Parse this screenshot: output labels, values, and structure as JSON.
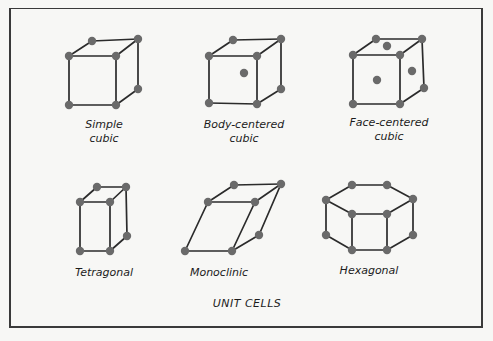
{
  "title": "UNIT CELLS",
  "colors": {
    "edge": "#2b2b2b",
    "atom": "#6a6a6a",
    "background": "#f7f7f5",
    "frame": "#3a3a3a"
  },
  "cells": [
    {
      "id": "simple-cubic",
      "label_line1": "Simple",
      "label_line2": "cubic",
      "label_pos": [
        104,
        118
      ],
      "vertices": [
        [
          69,
          56
        ],
        [
          116,
          56
        ],
        [
          92,
          41
        ],
        [
          138,
          39
        ],
        [
          69,
          105
        ],
        [
          116,
          105
        ],
        [
          138,
          89
        ]
      ],
      "edges": [
        [
          0,
          1
        ],
        [
          0,
          2
        ],
        [
          2,
          3
        ],
        [
          1,
          3
        ],
        [
          0,
          4
        ],
        [
          1,
          5
        ],
        [
          4,
          5
        ],
        [
          5,
          6
        ],
        [
          3,
          6
        ]
      ],
      "extra_atoms": []
    },
    {
      "id": "body-centered-cubic",
      "label_line1": "Body-centered",
      "label_line2": "cubic",
      "label_pos": [
        244,
        118
      ],
      "vertices": [
        [
          209,
          56
        ],
        [
          257,
          56
        ],
        [
          233,
          40
        ],
        [
          281,
          39
        ],
        [
          209,
          103
        ],
        [
          257,
          104
        ],
        [
          281,
          89
        ]
      ],
      "edges": [
        [
          0,
          1
        ],
        [
          0,
          2
        ],
        [
          2,
          3
        ],
        [
          1,
          3
        ],
        [
          0,
          4
        ],
        [
          1,
          5
        ],
        [
          4,
          5
        ],
        [
          5,
          6
        ],
        [
          3,
          6
        ]
      ],
      "extra_atoms": [
        [
          244,
          73
        ]
      ]
    },
    {
      "id": "face-centered-cubic",
      "label_line1": "Face-centered",
      "label_line2": "cubic",
      "label_pos": [
        389,
        116
      ],
      "vertices": [
        [
          353,
          55
        ],
        [
          400,
          55
        ],
        [
          376,
          39
        ],
        [
          422,
          39
        ],
        [
          353,
          104
        ],
        [
          400,
          104
        ],
        [
          424,
          88
        ]
      ],
      "edges": [
        [
          0,
          1
        ],
        [
          0,
          2
        ],
        [
          2,
          3
        ],
        [
          1,
          3
        ],
        [
          0,
          4
        ],
        [
          1,
          5
        ],
        [
          4,
          5
        ],
        [
          5,
          6
        ],
        [
          3,
          6
        ]
      ],
      "extra_atoms": [
        [
          387,
          46
        ],
        [
          377,
          80
        ],
        [
          412,
          71
        ]
      ]
    },
    {
      "id": "tetragonal",
      "label_line1": "Tetragonal",
      "label_line2": "",
      "label_pos": [
        104,
        266
      ],
      "vertices": [
        [
          80,
          202
        ],
        [
          110,
          202
        ],
        [
          97,
          187
        ],
        [
          126,
          187
        ],
        [
          80,
          251
        ],
        [
          110,
          251
        ],
        [
          127,
          236
        ]
      ],
      "edges": [
        [
          0,
          1
        ],
        [
          0,
          2
        ],
        [
          2,
          3
        ],
        [
          1,
          3
        ],
        [
          0,
          4
        ],
        [
          1,
          5
        ],
        [
          4,
          5
        ],
        [
          5,
          6
        ],
        [
          3,
          6
        ]
      ],
      "extra_atoms": []
    },
    {
      "id": "monoclinic",
      "label_line1": "Monoclinic",
      "label_line2": "",
      "label_pos": [
        219,
        266
      ],
      "vertices": [
        [
          208,
          202
        ],
        [
          255,
          202
        ],
        [
          234,
          185
        ],
        [
          281,
          184
        ],
        [
          185,
          251
        ],
        [
          232,
          251
        ],
        [
          259,
          235
        ]
      ],
      "edges": [
        [
          0,
          1
        ],
        [
          0,
          2
        ],
        [
          2,
          3
        ],
        [
          1,
          3
        ],
        [
          0,
          4
        ],
        [
          1,
          5
        ],
        [
          4,
          5
        ],
        [
          5,
          6
        ],
        [
          3,
          6
        ]
      ],
      "extra_atoms": []
    },
    {
      "id": "hexagonal",
      "label_line1": "Hexagonal",
      "label_line2": "",
      "label_pos": [
        369,
        264
      ],
      "vertices": [
        [
          352,
          185
        ],
        [
          387,
          185
        ],
        [
          326,
          200
        ],
        [
          413,
          199
        ],
        [
          352,
          214
        ],
        [
          387,
          214
        ],
        [
          326,
          235
        ],
        [
          413,
          235
        ],
        [
          352,
          250
        ],
        [
          387,
          250
        ]
      ],
      "edges": [
        [
          0,
          1
        ],
        [
          0,
          2
        ],
        [
          1,
          3
        ],
        [
          2,
          4
        ],
        [
          3,
          5
        ],
        [
          4,
          5
        ],
        [
          2,
          6
        ],
        [
          4,
          8
        ],
        [
          5,
          9
        ],
        [
          3,
          7
        ],
        [
          6,
          8
        ],
        [
          8,
          9
        ],
        [
          9,
          7
        ]
      ],
      "extra_atoms": []
    }
  ],
  "title_pos": [
    247,
    297
  ]
}
